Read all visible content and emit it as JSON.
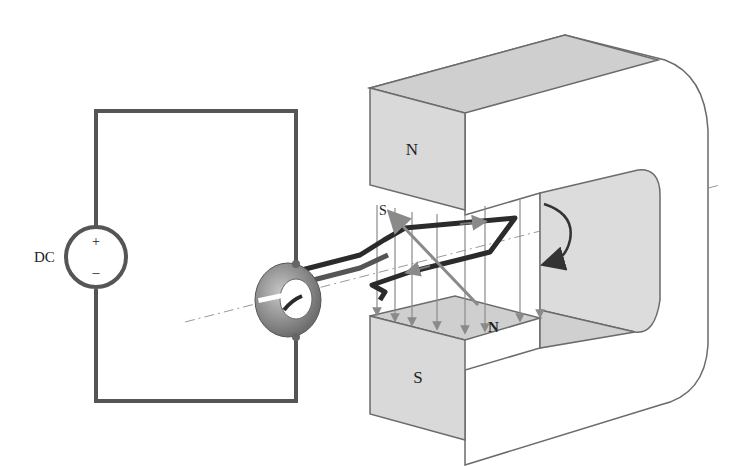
{
  "diagram": {
    "type": "DC motor schematic",
    "source_label": "DC",
    "source_plus": "+",
    "source_minus": "–",
    "magnet_north_label": "N",
    "magnet_south_label": "S",
    "coil_north_label": "N",
    "coil_south_label": "S",
    "colors": {
      "wire": "#555555",
      "magnet_face": "#d9d9d9",
      "magnet_top": "#cfcfcf",
      "magnet_body": "#ffffff",
      "outline": "#6b6b6b",
      "coil": "#2b2b2b",
      "field_arrow": "#8a8a8a",
      "commutator": "#8c8c8c"
    }
  }
}
